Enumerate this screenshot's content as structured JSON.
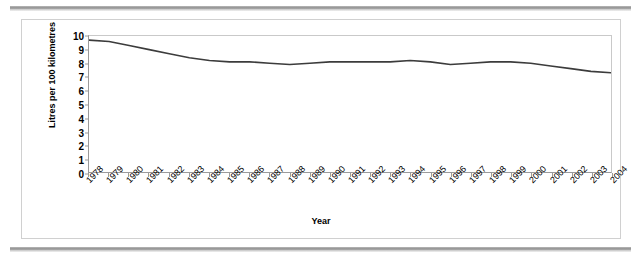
{
  "chart_data": {
    "type": "line",
    "title": "",
    "xlabel": "Year",
    "ylabel": "Litres per 100 kilometres",
    "x": [
      1978,
      1979,
      1980,
      1981,
      1982,
      1983,
      1984,
      1985,
      1986,
      1987,
      1988,
      1989,
      1990,
      1991,
      1992,
      1993,
      1994,
      1995,
      1996,
      1997,
      1998,
      1999,
      2000,
      2001,
      2002,
      2003,
      2004
    ],
    "categories": [
      "1978",
      "1979",
      "1980",
      "1981",
      "1982",
      "1983",
      "1984",
      "1985",
      "1986",
      "1987",
      "1988",
      "1989",
      "1990",
      "1991",
      "1992",
      "1993",
      "1994",
      "1995",
      "1996",
      "1997",
      "1998",
      "1999",
      "2000",
      "2001",
      "2002",
      "2003",
      "2004"
    ],
    "values": [
      9.7,
      9.6,
      9.3,
      9.0,
      8.7,
      8.4,
      8.2,
      8.1,
      8.1,
      8.0,
      7.9,
      8.0,
      8.1,
      8.1,
      8.1,
      8.1,
      8.2,
      8.1,
      7.9,
      8.0,
      8.1,
      8.1,
      8.0,
      7.8,
      7.6,
      7.4,
      7.3
    ],
    "series": [
      {
        "name": "Average fuel consumption",
        "values": [
          9.7,
          9.6,
          9.3,
          9.0,
          8.7,
          8.4,
          8.2,
          8.1,
          8.1,
          8.0,
          7.9,
          8.0,
          8.1,
          8.1,
          8.1,
          8.1,
          8.2,
          8.1,
          7.9,
          8.0,
          8.1,
          8.1,
          8.0,
          7.8,
          7.6,
          7.4,
          7.3
        ],
        "color": "#3c3c3c"
      }
    ],
    "yticks": [
      0,
      1,
      2,
      3,
      4,
      5,
      6,
      7,
      8,
      9,
      10
    ],
    "ylim": [
      0,
      10
    ],
    "xlim": [
      1978,
      2004
    ],
    "grid": false,
    "legend": null,
    "legend_position": "none"
  },
  "colors": {
    "line": "#3c3c3c",
    "axis": "#9a9a9a",
    "frame_border": "#d0d0d0",
    "rule": "#8e8e8e",
    "text": "#000000",
    "background": "#ffffff"
  }
}
